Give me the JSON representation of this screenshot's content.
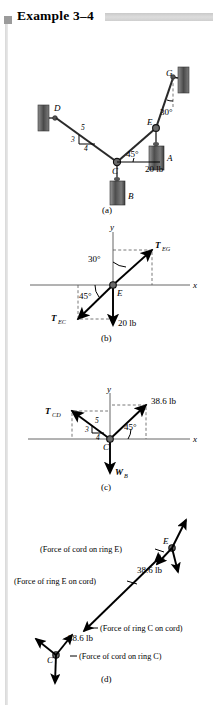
{
  "header": {
    "marker": "square-marker",
    "title": "Example 3–4",
    "bar": "gray-rule"
  },
  "figure": {
    "captions": {
      "a": "(a)",
      "b": "(b)",
      "c": "(c)",
      "d": "(d)"
    },
    "panel_a": {
      "points": {
        "A": "A",
        "B": "B",
        "C": "C",
        "D": "D",
        "E": "E",
        "G": "G"
      },
      "angle_30": "30°",
      "angle_45": "45°",
      "load": "20 lb",
      "slope": {
        "hyp": "5",
        "vert": "3",
        "horz": "4"
      }
    },
    "panel_b": {
      "origin": "E",
      "axis_x": "x",
      "axis_y": "y",
      "t_eg": {
        "sym": "T",
        "sub": "EG"
      },
      "t_ec": {
        "sym": "T",
        "sub": "EC"
      },
      "angle_30": "30°",
      "angle_45": "45°",
      "load": "20 lb"
    },
    "panel_c": {
      "origin": "C",
      "axis_x": "x",
      "axis_y": "y",
      "t_cd": {
        "sym": "T",
        "sub": "CD"
      },
      "w_b": {
        "sym": "W",
        "sub": "B"
      },
      "force": "38.6 lb",
      "angle_45": "45°",
      "slope": {
        "hyp": "5",
        "vert": "3",
        "horz": "4"
      }
    },
    "panel_d": {
      "ring_e": "E",
      "ring_c": "C",
      "force_top": "38.6 lb",
      "force_bottom": "38.6 lb",
      "note_cord_on_e": "(Force of cord on ring E)",
      "note_e_on_cord": "(Force of ring E on cord)",
      "note_c_on_cord": "(Force of ring C on cord)",
      "note_cord_on_c": "(Force of cord on ring C)"
    }
  },
  "colors": {
    "ink": "#1a1a1a",
    "rule_gray": "#cfcfcf",
    "axis_gray": "#555555",
    "block_fill": "#6f6f6f"
  }
}
